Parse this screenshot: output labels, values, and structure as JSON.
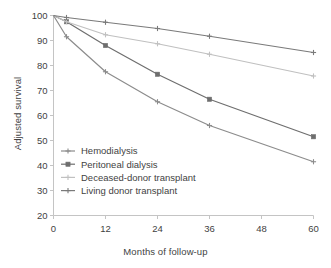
{
  "chart_data": {
    "type": "line",
    "title": "",
    "xlabel": "Months of follow-up",
    "ylabel": "Adjusted survival",
    "x": [
      0,
      3,
      12,
      24,
      36,
      60
    ],
    "xticks": [
      0,
      12,
      24,
      36,
      48,
      60
    ],
    "yticks": [
      20,
      30,
      40,
      50,
      60,
      70,
      80,
      90,
      100
    ],
    "xlim": [
      0,
      60
    ],
    "ylim": [
      20,
      100
    ],
    "grid": false,
    "legend_position": "center-left",
    "series": [
      {
        "name": "Hemodialysis",
        "marker": "cross",
        "color": "#8c8c8c",
        "values": [
          100,
          91.5,
          77.5,
          65.5,
          56.0,
          41.5
        ]
      },
      {
        "name": "Peritoneal dialysis",
        "marker": "square",
        "color": "#6e6e6e",
        "values": [
          100,
          97.5,
          88.0,
          76.5,
          66.5,
          51.5
        ]
      },
      {
        "name": "Deceased-donor transplant",
        "marker": "cross",
        "color": "#c0c0c0",
        "values": [
          100,
          97.5,
          92.3,
          88.7,
          84.5,
          75.8
        ]
      },
      {
        "name": "Living donor transplant",
        "marker": "cross",
        "color": "#7a7a7a",
        "values": [
          100,
          99.2,
          97.3,
          94.8,
          91.7,
          85.2
        ]
      }
    ]
  },
  "caption": ""
}
